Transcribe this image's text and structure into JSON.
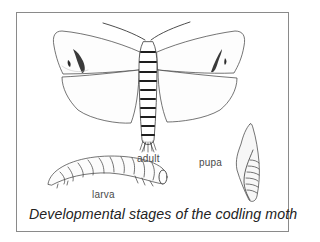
{
  "diagram": {
    "caption": "Developmental stages of the codling moth",
    "stages": [
      {
        "id": "adult",
        "label": "adult"
      },
      {
        "id": "larva",
        "label": "larva"
      },
      {
        "id": "pupa",
        "label": "pupa"
      }
    ],
    "colors": {
      "ink": "#2a2a2a",
      "frame": "#8a8a8a",
      "label": "#4a4a4a",
      "background": "#ffffff"
    }
  }
}
